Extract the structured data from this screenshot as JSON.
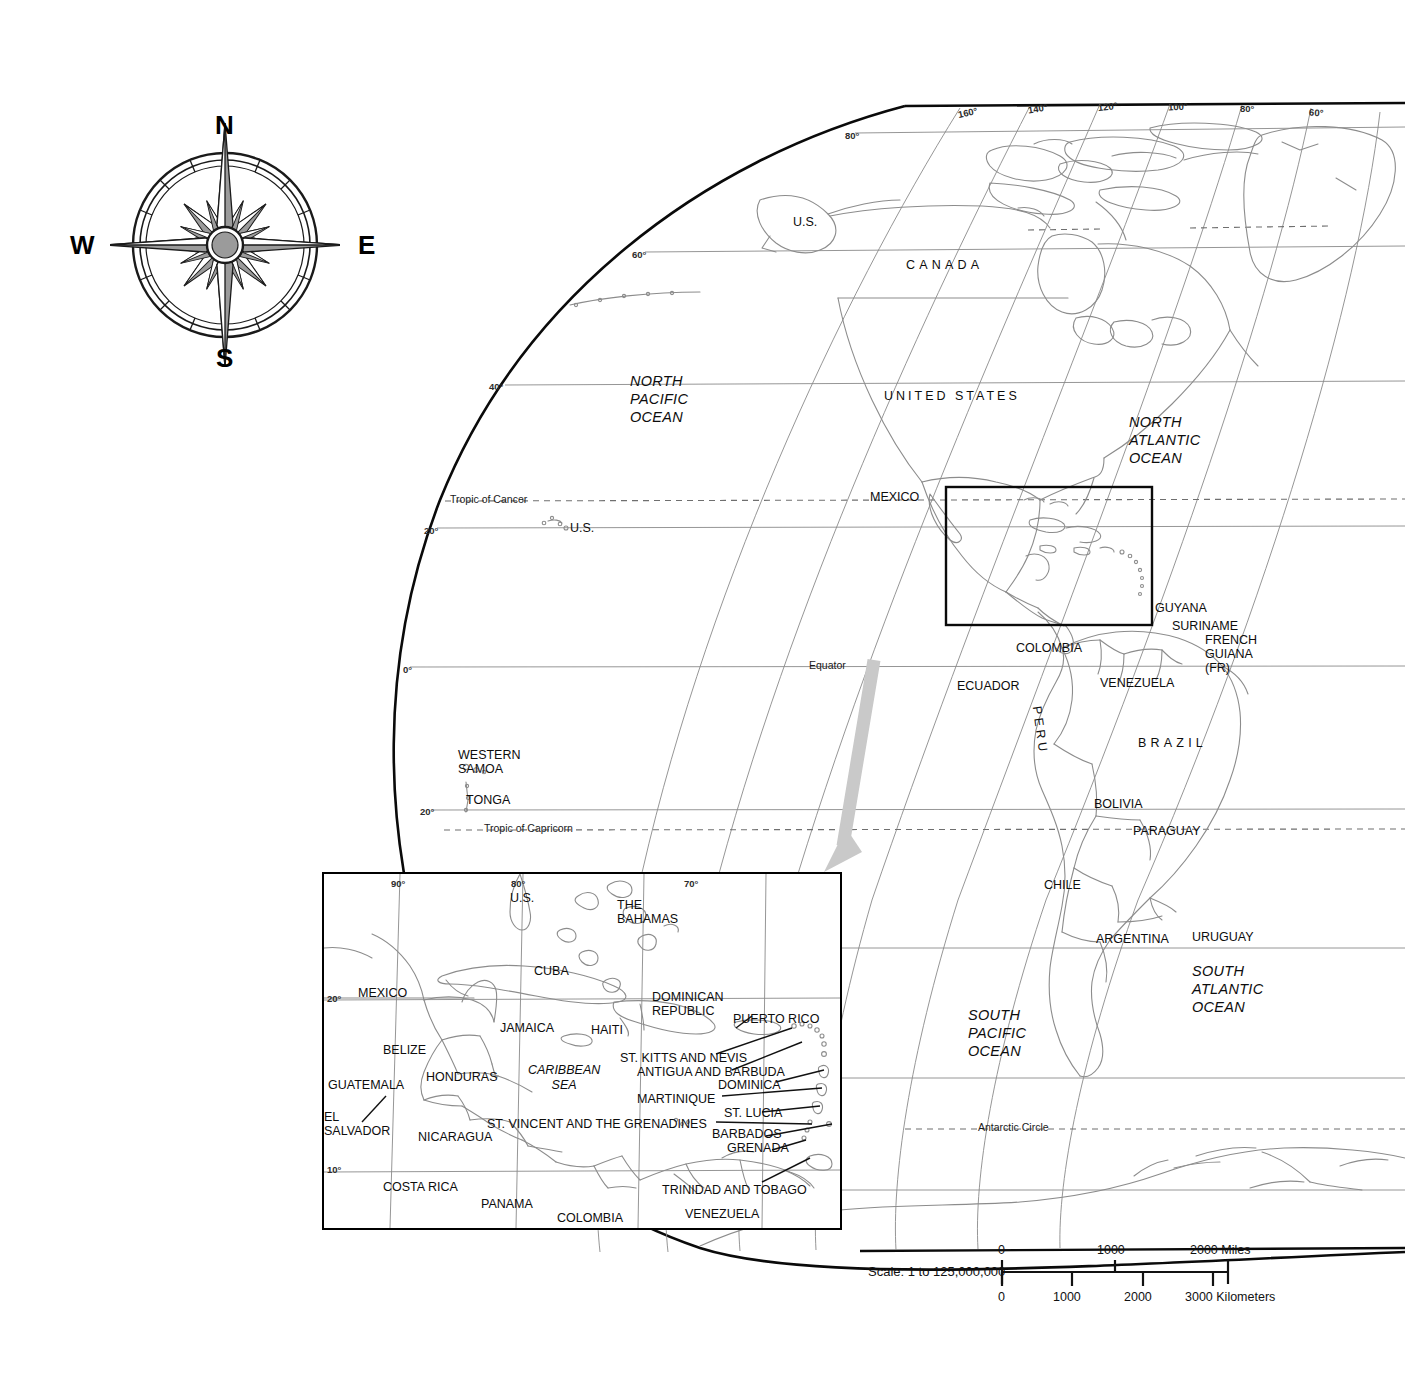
{
  "map": {
    "title": "World map of the Americas with Caribbean inset",
    "projection_note": "Globe graticule, Western Hemisphere",
    "colors": {
      "coastline": "#8c8c8c",
      "graticule": "#8a8a8a",
      "frame": "#000000",
      "dashed_circle": "#6f6f6f",
      "arrow": "#c9c9c9",
      "compass_fill": "#9b9b9b",
      "text": "#111111"
    }
  },
  "compass": {
    "name": "compass-rose",
    "north": "N",
    "east": "E",
    "south": "S",
    "west": "W"
  },
  "graticule": {
    "longitude_labels": [
      {
        "text": "160°",
        "x": 958,
        "y": 108
      },
      {
        "text": "140°",
        "x": 1028,
        "y": 104
      },
      {
        "text": "120°",
        "x": 1098,
        "y": 102
      },
      {
        "text": "100°",
        "x": 1168,
        "y": 102
      },
      {
        "text": "80°",
        "x": 1240,
        "y": 104
      },
      {
        "text": "60°",
        "x": 1309,
        "y": 108
      }
    ],
    "latitude_labels": [
      {
        "text": "80°",
        "x": 845,
        "y": 131
      },
      {
        "text": "60°",
        "x": 632,
        "y": 250
      },
      {
        "text": "40°",
        "x": 489,
        "y": 382
      },
      {
        "text": "20°",
        "x": 424,
        "y": 526
      },
      {
        "text": "0°",
        "x": 403,
        "y": 665
      },
      {
        "text": "20°",
        "x": 420,
        "y": 807
      }
    ],
    "special_lines": [
      {
        "text": "Tropic of Cancer",
        "x": 450,
        "y": 494
      },
      {
        "text": "Equator",
        "x": 809,
        "y": 660
      },
      {
        "text": "Tropic of Capricorn",
        "x": 484,
        "y": 823
      },
      {
        "text": "Antarctic Circle",
        "x": 978,
        "y": 1122
      }
    ]
  },
  "oceans": [
    {
      "name": "north-pacific-ocean",
      "lines": [
        "NORTH",
        "PACIFIC",
        "OCEAN"
      ],
      "x": 630,
      "y": 372
    },
    {
      "name": "north-atlantic-ocean",
      "lines": [
        "NORTH",
        "ATLANTIC",
        "OCEAN"
      ],
      "x": 1129,
      "y": 413
    },
    {
      "name": "south-pacific-ocean",
      "lines": [
        "SOUTH",
        "PACIFIC",
        "OCEAN"
      ],
      "x": 968,
      "y": 1006
    },
    {
      "name": "south-atlantic-ocean",
      "lines": [
        "SOUTH",
        "ATLANTIC",
        "OCEAN"
      ],
      "x": 1192,
      "y": 962
    }
  ],
  "main_map_labels": [
    {
      "name": "label-us-alaska",
      "text": "U.S.",
      "x": 793,
      "y": 215,
      "style": "country"
    },
    {
      "name": "label-canada",
      "text": "CANADA",
      "x": 906,
      "y": 258,
      "style": "spaced"
    },
    {
      "name": "label-united-states",
      "text": "UNITED  STATES",
      "x": 884,
      "y": 389,
      "style": "spaced-sm"
    },
    {
      "name": "label-mexico",
      "text": "MEXICO",
      "x": 870,
      "y": 490,
      "style": "country"
    },
    {
      "name": "label-us-hawaii",
      "text": "U.S.",
      "x": 570,
      "y": 521,
      "style": "country"
    },
    {
      "name": "label-western-samoa",
      "text": "WESTERN\nSAMOA",
      "x": 458,
      "y": 750,
      "style": "country"
    },
    {
      "name": "label-tonga",
      "text": "TONGA",
      "x": 466,
      "y": 793,
      "style": "country"
    },
    {
      "name": "label-colombia",
      "text": "COLOMBIA",
      "x": 1016,
      "y": 641,
      "style": "country"
    },
    {
      "name": "label-ecuador",
      "text": "ECUADOR",
      "x": 957,
      "y": 679,
      "style": "country"
    },
    {
      "name": "label-venezuela",
      "text": "VENEZUELA",
      "x": 1100,
      "y": 676,
      "style": "country"
    },
    {
      "name": "label-guyana",
      "text": "GUYANA",
      "x": 1155,
      "y": 601,
      "style": "country"
    },
    {
      "name": "label-suriname",
      "text": "SURINAME",
      "x": 1172,
      "y": 619,
      "style": "country"
    },
    {
      "name": "label-french-guiana",
      "text": "FRENCH\nGUIANA\n(FR)",
      "x": 1205,
      "y": 635,
      "style": "country"
    },
    {
      "name": "label-brazil",
      "text": "BRAZIL",
      "x": 1138,
      "y": 736,
      "style": "spaced"
    },
    {
      "name": "label-peru",
      "text": "PERU",
      "x": 1035,
      "y": 710,
      "style": "vertical"
    },
    {
      "name": "label-bolivia",
      "text": "BOLIVIA",
      "x": 1094,
      "y": 797,
      "style": "country"
    },
    {
      "name": "label-paraguay",
      "text": "PARAGUAY",
      "x": 1133,
      "y": 824,
      "style": "country"
    },
    {
      "name": "label-chile",
      "text": "CHILE",
      "x": 1044,
      "y": 878,
      "style": "country"
    },
    {
      "name": "label-argentina",
      "text": "ARGENTINA",
      "x": 1096,
      "y": 932,
      "style": "country"
    },
    {
      "name": "label-uruguay",
      "text": "URUGUAY",
      "x": 1192,
      "y": 930,
      "style": "country"
    }
  ],
  "inset": {
    "title": "Caribbean detail inset",
    "frame": {
      "x": 322,
      "y": 872,
      "width": 516,
      "height": 354
    },
    "graticule": {
      "longitude_labels": [
        {
          "text": "90°",
          "x": 391,
          "y": 879
        },
        {
          "text": "80°",
          "x": 511,
          "y": 879
        },
        {
          "text": "70°",
          "x": 684,
          "y": 879
        }
      ],
      "latitude_labels": [
        {
          "text": "20°",
          "x": 327,
          "y": 994
        },
        {
          "text": "10°",
          "x": 327,
          "y": 1165
        }
      ]
    },
    "labels": [
      {
        "name": "inset-label-us",
        "text": "U.S.",
        "x": 510,
        "y": 891
      },
      {
        "name": "inset-label-the-bahamas",
        "text": "THE\nBAHAMAS",
        "x": 617,
        "y": 900
      },
      {
        "name": "inset-label-cuba",
        "text": "CUBA",
        "x": 534,
        "y": 964
      },
      {
        "name": "inset-label-mexico",
        "text": "MEXICO",
        "x": 358,
        "y": 986
      },
      {
        "name": "inset-label-jamaica",
        "text": "JAMAICA",
        "x": 500,
        "y": 1021
      },
      {
        "name": "inset-label-haiti",
        "text": "HAITI",
        "x": 591,
        "y": 1023
      },
      {
        "name": "inset-label-dominican-republic",
        "text": "DOMINICAN\nREPUBLIC",
        "x": 652,
        "y": 992
      },
      {
        "name": "inset-label-puerto-rico",
        "text": "PUERTO RICO",
        "x": 733,
        "y": 1012
      },
      {
        "name": "inset-label-belize",
        "text": "BELIZE",
        "x": 383,
        "y": 1043
      },
      {
        "name": "inset-label-honduras",
        "text": "HONDURAS",
        "x": 426,
        "y": 1070
      },
      {
        "name": "inset-label-guatemala",
        "text": "GUATEMALA",
        "x": 328,
        "y": 1078
      },
      {
        "name": "inset-label-caribbean-sea",
        "text": "CARIBBEAN\nSEA",
        "x": 534,
        "y": 1065
      },
      {
        "name": "inset-label-el-salvador",
        "text": "EL\nSALVADOR",
        "x": 324,
        "y": 1112
      },
      {
        "name": "inset-label-nicaragua",
        "text": "NICARAGUA",
        "x": 418,
        "y": 1130
      },
      {
        "name": "inset-label-costa-rica",
        "text": "COSTA RICA",
        "x": 383,
        "y": 1180
      },
      {
        "name": "inset-label-panama",
        "text": "PANAMA",
        "x": 481,
        "y": 1197
      },
      {
        "name": "inset-label-colombia",
        "text": "COLOMBIA",
        "x": 557,
        "y": 1211
      },
      {
        "name": "inset-label-venezuela",
        "text": "VENEZUELA",
        "x": 685,
        "y": 1207
      },
      {
        "name": "inset-label-st-kitts-nevis",
        "text": "ST. KITTS AND NEVIS",
        "x": 620,
        "y": 1051
      },
      {
        "name": "inset-label-antigua-barbuda",
        "text": "ANTIGUA AND BARBUDA",
        "x": 637,
        "y": 1066
      },
      {
        "name": "inset-label-dominica",
        "text": "DOMINICA",
        "x": 718,
        "y": 1078
      },
      {
        "name": "inset-label-martinique",
        "text": "MARTINIQUE",
        "x": 637,
        "y": 1092
      },
      {
        "name": "inset-label-st-lucia",
        "text": "ST. LUCIA",
        "x": 724,
        "y": 1106
      },
      {
        "name": "inset-label-st-vincent",
        "text": "ST. VINCENT AND THE GRENADINES",
        "x": 487,
        "y": 1117
      },
      {
        "name": "inset-label-barbados",
        "text": "BARBADOS",
        "x": 712,
        "y": 1127
      },
      {
        "name": "inset-label-grenada",
        "text": "GRENADA",
        "x": 727,
        "y": 1141
      },
      {
        "name": "inset-label-trinidad-tobago",
        "text": "TRINIDAD AND TOBAGO",
        "x": 662,
        "y": 1183
      }
    ]
  },
  "scale": {
    "name": "scale-bar",
    "label": "Scale:  1 to 125,000,000",
    "miles_unit": "Miles",
    "kilometers_unit": "Kilometers",
    "miles_ticks": [
      "0",
      "1000",
      "2000"
    ],
    "km_ticks": [
      "0",
      "1000",
      "2000",
      "3000"
    ],
    "miles_label": "2000 Miles",
    "km_label": "3000 Kilometers"
  }
}
